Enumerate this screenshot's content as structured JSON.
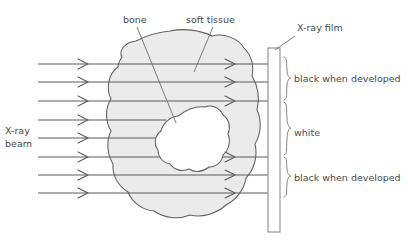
{
  "diagram": {
    "type": "physics-schematic",
    "background_color": "#ffffff",
    "line_color": "#5a5a5a",
    "text_color": "#4a4a4a",
    "tissue_fill": "#ebebeb",
    "bone_fill": "#ffffff"
  },
  "labels": {
    "bone": "bone",
    "soft_tissue": "soft tissue",
    "xray_film": "X-ray film",
    "xray_beam_line1": "X-ray",
    "xray_beam_line2": "beam",
    "black_top": "black when developed",
    "white_middle": "white",
    "black_bottom": "black when developed"
  },
  "film_regions": [
    {
      "id": "region-top",
      "label": "black when developed",
      "from_y": 57,
      "to_y": 100
    },
    {
      "id": "region-middle",
      "label": "white",
      "from_y": 102,
      "to_y": 155
    },
    {
      "id": "region-bottom",
      "label": "black when developed",
      "from_y": 157,
      "to_y": 197
    }
  ],
  "rays": [
    {
      "id": "ray-1",
      "y": 64,
      "blocked_by_bone": false
    },
    {
      "id": "ray-2",
      "y": 82,
      "blocked_by_bone": false
    },
    {
      "id": "ray-3",
      "y": 101,
      "blocked_by_bone": false
    },
    {
      "id": "ray-4",
      "y": 120,
      "blocked_by_bone": true
    },
    {
      "id": "ray-5",
      "y": 138,
      "blocked_by_bone": true
    },
    {
      "id": "ray-6",
      "y": 157,
      "blocked_by_bone": false
    },
    {
      "id": "ray-7",
      "y": 175,
      "blocked_by_bone": false
    },
    {
      "id": "ray-8",
      "y": 193,
      "blocked_by_bone": false
    }
  ],
  "film": {
    "x": 268,
    "y": 48,
    "width": 12,
    "height": 184
  }
}
